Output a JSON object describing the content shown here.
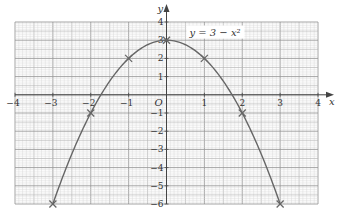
{
  "chart_data": {
    "type": "line",
    "title": "",
    "xlabel": "x",
    "ylabel": "y",
    "origin_label": "O",
    "xlim": [
      -4,
      4
    ],
    "ylim": [
      -6,
      4
    ],
    "grid": true,
    "grid_minor_step": 0.1,
    "grid_medium_step": 0.5,
    "x_ticks": [
      -4,
      -3,
      -2,
      -1,
      1,
      2,
      3,
      4
    ],
    "x_tick_labels": [
      "−4",
      "−3",
      "−2",
      "−1",
      "1",
      "2",
      "3",
      "4"
    ],
    "y_ticks": [
      4,
      3,
      2,
      1,
      -1,
      -2,
      -3,
      -4,
      -5,
      -6
    ],
    "y_tick_labels": [
      "4",
      "3",
      "2",
      "1",
      "−1",
      "−2",
      "−3",
      "−4",
      "−5",
      "−6"
    ],
    "series": [
      {
        "name": "y = 3 − x²",
        "function": "3 - x^2",
        "x_range": [
          -3,
          3
        ],
        "points": [
          {
            "x": -3,
            "y": -6
          },
          {
            "x": -2,
            "y": -1
          },
          {
            "x": -1,
            "y": 2
          },
          {
            "x": 0,
            "y": 3
          },
          {
            "x": 1,
            "y": 2
          },
          {
            "x": 2,
            "y": -1
          },
          {
            "x": 3,
            "y": -6
          }
        ],
        "marker": "cross",
        "label_position": "near-vertex-right"
      }
    ],
    "annotations": [
      {
        "text": "y = 3 − x²",
        "anchor": {
          "x": 0.5,
          "y": 3.2
        }
      }
    ]
  },
  "colors": {
    "grid_minor": "#d4d4d4",
    "grid_medium": "#b8b8b8",
    "grid_major": "#9a9a9a",
    "axis": "#444444",
    "curve": "#666666",
    "marker": "#666666",
    "text": "#333333"
  }
}
